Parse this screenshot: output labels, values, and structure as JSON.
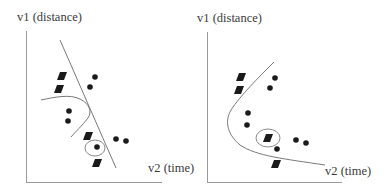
{
  "panels": [
    {
      "id": "left",
      "y_label": "v1 (distance)",
      "x_label": "v2 (time)",
      "boundary_type": "linear with local nonlinear curve",
      "diamonds": [
        [
          62,
          76
        ],
        [
          59,
          89
        ],
        [
          88,
          136
        ],
        [
          97,
          163
        ]
      ],
      "dots": [
        [
          95,
          77
        ],
        [
          90,
          87
        ],
        [
          69,
          111
        ],
        [
          68,
          121
        ],
        [
          116,
          139
        ],
        [
          126,
          141
        ],
        [
          97,
          147
        ]
      ],
      "highlight": {
        "shape": "dot",
        "at": [
          97,
          147
        ],
        "r": 9
      }
    },
    {
      "id": "right",
      "y_label": "v1 (distance)",
      "x_label": "v2 (time)",
      "boundary_type": "nonlinear curve",
      "diamonds": [
        [
          241,
          77
        ],
        [
          239,
          90
        ],
        [
          268,
          138
        ],
        [
          276,
          164
        ]
      ],
      "dots": [
        [
          275,
          78
        ],
        [
          270,
          88
        ],
        [
          248,
          113
        ],
        [
          247,
          125
        ],
        [
          296,
          140
        ],
        [
          306,
          143
        ],
        [
          277,
          149
        ]
      ],
      "highlight": {
        "shape": "diamond",
        "at": [
          268,
          138
        ],
        "r": 10
      }
    }
  ],
  "colors": {
    "marker": "#1a1a1a",
    "axis": "#9a9a9a",
    "boundary": "#7a7a7a",
    "label": "#3a3a3a"
  }
}
